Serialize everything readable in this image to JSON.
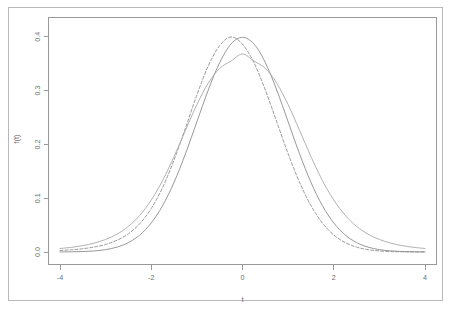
{
  "chart_data": {
    "type": "line",
    "title": "",
    "xlabel": "t",
    "ylabel": "f(t)",
    "xlim": [
      -4,
      4
    ],
    "ylim": [
      0,
      0.42
    ],
    "grid": false,
    "legend": "none",
    "x_ticks": [
      "-4",
      "-2",
      "0",
      "2",
      "4"
    ],
    "x_tick_values": [
      -4,
      -2,
      0,
      2,
      4
    ],
    "y_ticks": [
      "0.0",
      "0.1",
      "0.2",
      "0.3",
      "0.4"
    ],
    "y_tick_values": [
      0.0,
      0.1,
      0.2,
      0.3,
      0.4
    ],
    "x": [
      -4,
      -3.75,
      -3.5,
      -3.25,
      -3,
      -2.75,
      -2.5,
      -2.25,
      -2,
      -1.75,
      -1.5,
      -1.25,
      -1,
      -0.75,
      -0.5,
      -0.25,
      0,
      0.25,
      0.5,
      0.75,
      1,
      1.25,
      1.5,
      1.75,
      2,
      2.25,
      2.5,
      2.75,
      3,
      3.25,
      3.5,
      3.75,
      4
    ],
    "series": [
      {
        "name": "normal",
        "style": "solid",
        "color": "#8c8c8c",
        "peak": 0.399,
        "values": [
          0.0001,
          0.0004,
          0.0009,
          0.002,
          0.0044,
          0.0091,
          0.0175,
          0.0317,
          0.054,
          0.0863,
          0.1295,
          0.1826,
          0.242,
          0.3011,
          0.3521,
          0.3867,
          0.3989,
          0.3867,
          0.3521,
          0.3011,
          0.242,
          0.1826,
          0.1295,
          0.0863,
          0.054,
          0.0317,
          0.0175,
          0.0091,
          0.0044,
          0.002,
          0.0009,
          0.0004,
          0.0001
        ]
      },
      {
        "name": "t-dashed",
        "style": "dashed",
        "color": "#8c8c8c",
        "peak": 0.386,
        "values": [
          0.0028,
          0.0041,
          0.0061,
          0.0092,
          0.0141,
          0.0218,
          0.034,
          0.0528,
          0.0808,
          0.1201,
          0.1709,
          0.2303,
          0.2917,
          0.3459,
          0.3836,
          0.3997,
          0.3862,
          0.3521,
          0.3011,
          0.242,
          0.1826,
          0.1295,
          0.0863,
          0.054,
          0.0317,
          0.0175,
          0.0091,
          0.0044,
          0.002,
          0.0009,
          0.0004,
          0.0001,
          0.0001
        ]
      },
      {
        "name": "t-low-df",
        "style": "solid",
        "color": "#a8a8a8",
        "peak": 0.368,
        "values": [
          0.0065,
          0.0087,
          0.0119,
          0.0165,
          0.0233,
          0.0332,
          0.0477,
          0.0683,
          0.0965,
          0.1331,
          0.1773,
          0.2261,
          0.2738,
          0.3139,
          0.3412,
          0.3549,
          0.368,
          0.3549,
          0.3412,
          0.3139,
          0.2738,
          0.2261,
          0.1773,
          0.1331,
          0.0965,
          0.0683,
          0.0477,
          0.0332,
          0.0233,
          0.0165,
          0.0119,
          0.0087,
          0.0065
        ]
      }
    ]
  },
  "figure": {
    "background_color": "#ffffff",
    "border_color": "#b9b9b9",
    "frame_color": "#9a9a9a",
    "text_color": "#6f6f6f"
  }
}
